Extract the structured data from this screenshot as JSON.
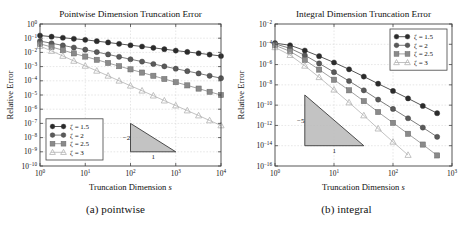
{
  "figure": {
    "panels": [
      {
        "id": "pointwise",
        "subcaption": "(a) pointwise",
        "title": "Pointwise Dimension Truncation Error",
        "xlabel_main": "Truncation Dimension",
        "xlabel_var": "s",
        "ylabel": "Relative Error",
        "slope_label": "−2",
        "base_label": "1"
      },
      {
        "id": "integral",
        "subcaption": "(b) integral",
        "title": "Integral Dimension Truncation Error",
        "xlabel_main": "Truncation Dimension",
        "xlabel_var": "s",
        "ylabel": "Relative Error",
        "slope_label": "−5",
        "base_label": "1"
      }
    ]
  },
  "chart_data": [
    {
      "type": "line",
      "id": "pointwise",
      "title": "Pointwise Dimension Truncation Error",
      "subcaption": "(a) pointwise",
      "xlabel": "Truncation Dimension s",
      "ylabel": "Relative Error",
      "xscale": "log",
      "yscale": "log",
      "xlim": [
        1,
        10000
      ],
      "ylim": [
        1e-10,
        1
      ],
      "xticks": [
        1,
        10,
        100,
        1000,
        10000
      ],
      "xtick_labels": [
        "10^0",
        "10^1",
        "10^2",
        "10^3",
        "10^4"
      ],
      "yticks": [
        1,
        0.1,
        0.01,
        0.001,
        0.0001,
        1e-05,
        1e-06,
        1e-07,
        1e-08,
        1e-09,
        1e-10
      ],
      "ytick_labels": [
        "10^0",
        "10^-1",
        "10^-2",
        "10^-3",
        "10^-4",
        "10^-5",
        "10^-6",
        "10^-7",
        "10^-8",
        "10^-9",
        "10^-10"
      ],
      "grid": true,
      "legend_position": "lower left",
      "annotation": {
        "type": "slope-triangle",
        "slope_label": "-2",
        "base_label": "1",
        "x_range": [
          100,
          1000
        ],
        "y_top": 1e-07,
        "y_bottom": 1e-09
      },
      "series": [
        {
          "name": "ζ = 1.5",
          "marker": "filled-circle",
          "color": "#2b2b2b",
          "slope": -0.25,
          "x": [
            1,
            1.8,
            3.2,
            5.6,
            10,
            18,
            32,
            56,
            100,
            180,
            320,
            560,
            1000,
            1800,
            3200,
            5600,
            10000
          ],
          "y": [
            0.155,
            0.128,
            0.108,
            0.091,
            0.077,
            0.062,
            0.05,
            0.04,
            0.032,
            0.026,
            0.021,
            0.0168,
            0.0134,
            0.0108,
            0.0087,
            0.007,
            0.0056
          ]
        },
        {
          "name": "ζ = 2",
          "marker": "filled-circle",
          "color": "#5a5a5a",
          "slope": -0.5,
          "x": [
            1,
            1.8,
            3.2,
            5.6,
            10,
            18,
            32,
            56,
            100,
            180,
            320,
            560,
            1000,
            1800,
            3200,
            5600,
            10000
          ],
          "y": [
            0.063,
            0.044,
            0.031,
            0.022,
            0.0155,
            0.0106,
            0.0072,
            0.0049,
            0.0033,
            0.00225,
            0.00153,
            0.00104,
            0.00071,
            0.00048,
            0.00033,
            0.000225,
            0.000153
          ]
        },
        {
          "name": "ζ = 2.5",
          "marker": "filled-square",
          "color": "#8a8a8a",
          "slope": -0.75,
          "x": [
            1,
            1.8,
            3.2,
            5.6,
            10,
            18,
            32,
            56,
            100,
            180,
            320,
            560,
            1000,
            1800,
            3200,
            5600,
            10000
          ],
          "y": [
            0.04,
            0.024,
            0.0143,
            0.0085,
            0.0051,
            0.00302,
            0.0018,
            0.00107,
            0.00064,
            0.00038,
            0.000226,
            0.000134,
            8e-05,
            4.75e-05,
            2.83e-05,
            1.68e-05,
            1e-05
          ]
        },
        {
          "name": "ζ = 3",
          "marker": "open-triangle",
          "color": "#b3b3b3",
          "slope": -1.0,
          "x": [
            1,
            1.8,
            3.2,
            5.6,
            10,
            18,
            32,
            56,
            100,
            180,
            320,
            560,
            1000,
            1800,
            3200,
            5600,
            10000
          ],
          "y": [
            0.028,
            0.0125,
            0.0056,
            0.0025,
            0.00112,
            0.0005,
            0.000224,
            0.0001,
            4.47e-05,
            2e-05,
            8.94e-06,
            4e-06,
            1.79e-06,
            8e-07,
            3.57e-07,
            1.6e-07,
            7.14e-08
          ]
        }
      ]
    },
    {
      "type": "line",
      "id": "integral",
      "title": "Integral Dimension Truncation Error",
      "subcaption": "(b) integral",
      "xlabel": "Truncation Dimension s",
      "ylabel": "Relative Error",
      "xscale": "log",
      "yscale": "log",
      "xlim": [
        1,
        1000
      ],
      "ylim": [
        1e-16,
        0.01
      ],
      "xticks": [
        1,
        10,
        100,
        1000
      ],
      "xtick_labels": [
        "10^0",
        "10^1",
        "10^2",
        "10^3"
      ],
      "yticks": [
        0.01,
        0.0001,
        1e-06,
        1e-08,
        1e-10,
        1e-12,
        1e-14,
        1e-16
      ],
      "ytick_labels": [
        "10^-2",
        "10^-4",
        "10^-6",
        "10^-8",
        "10^-10",
        "10^-12",
        "10^-14",
        "10^-16"
      ],
      "grid": true,
      "legend_position": "upper right",
      "annotation": {
        "type": "slope-triangle",
        "slope_label": "-5",
        "base_label": "1",
        "x_range": [
          3.2,
          32
        ],
        "y_top": 1e-09,
        "y_bottom": 1e-14
      },
      "series": [
        {
          "name": "ζ = 1.5",
          "marker": "filled-circle",
          "color": "#2b2b2b",
          "slope": -2.2,
          "x": [
            1,
            1.8,
            3.2,
            5.6,
            10,
            18,
            32,
            56,
            100,
            180,
            320,
            560
          ],
          "y": [
            0.00013,
            8e-05,
            2.45e-05,
            6.7e-06,
            1.6e-06,
            3.4e-07,
            6.6e-08,
            1.3e-08,
            2.5e-09,
            4.6e-10,
            8.3e-11,
            1.6e-11
          ]
        },
        {
          "name": "ζ = 2",
          "marker": "filled-circle",
          "color": "#5a5a5a",
          "slope": -3.0,
          "x": [
            1,
            1.8,
            3.2,
            5.6,
            10,
            18,
            32,
            56,
            100,
            180,
            320,
            560
          ],
          "y": [
            0.00011,
            4e-05,
            8.2e-06,
            1.3e-06,
            1.8e-07,
            2.4e-08,
            2.9e-09,
            3.5e-10,
            4.2e-11,
            5.1e-12,
            6.2e-13,
            7.5e-14
          ]
        },
        {
          "name": "ζ = 2.5",
          "marker": "filled-square",
          "color": "#8a8a8a",
          "slope": -3.8,
          "x": [
            1,
            1.8,
            3.2,
            5.6,
            10,
            18,
            32,
            56,
            100,
            180,
            320,
            560
          ],
          "y": [
            8e-05,
            2e-05,
            2.8e-06,
            3.2e-07,
            3.2e-08,
            2.9e-09,
            2.5e-10,
            2.1e-11,
            1.8e-12,
            1.5e-13,
            1.3e-14,
            1.1e-15
          ]
        },
        {
          "name": "ζ = 3",
          "marker": "open-triangle",
          "color": "#b3b3b3",
          "slope": -4.7,
          "x": [
            1,
            1.8,
            3.2,
            5.6,
            10,
            18,
            32,
            56,
            100,
            180,
            320,
            560
          ],
          "y": [
            5e-05,
            8.5e-06,
            7.5e-07,
            5.6e-08,
            3.3e-09,
            1.8e-10,
            9.5e-12,
            4.8e-13,
            2.4e-14,
            1.2e-15,
            6e-17,
            3e-18
          ]
        }
      ]
    }
  ]
}
